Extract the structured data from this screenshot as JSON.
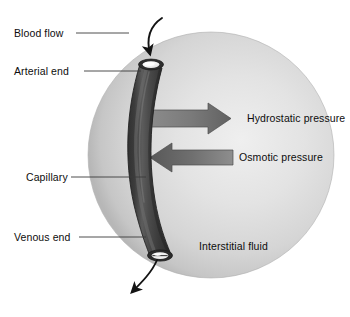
{
  "figure": {
    "background_color": "#ffffff"
  },
  "labels": {
    "blood_flow": "Blood flow",
    "arterial_end": "Arterial end",
    "capillary": "Capillary",
    "venous_end": "Venous end",
    "hydrostatic_pressure": "Hydrostatic pressure",
    "osmotic_pressure": "Osmotic pressure",
    "interstitial_fluid": "Interstitial fluid"
  },
  "colors": {
    "sphere_light": "#e6e6e6",
    "sphere_mid": "#d2d2d2",
    "sphere_edge": "#b9b9b9",
    "capillary_dark": "#3f3f3f",
    "capillary_mid": "#4f4f4f",
    "capillary_highlight": "#6b6b6b",
    "lumen": "#f2f2f2",
    "arrow_light": "#9a9a9a",
    "arrow_dark": "#5a5a5a",
    "flow_arrow": "#1a1a1a",
    "text": "#0d0d0d",
    "leader_line": "#3a3a3a"
  },
  "sphere": {
    "name": "interstitial-fluid-sphere",
    "center_x": 211,
    "center_y": 155,
    "radius": 123
  },
  "capillary": {
    "name": "capillary-tube",
    "orientation": "vertical",
    "curve": "bulges-left",
    "top_x": 151,
    "top_y": 62,
    "bottom_x": 153,
    "bottom_y": 256,
    "width": 28
  },
  "pressure_arrows": [
    {
      "name": "hydrostatic-pressure-arrow",
      "label": "Hydrostatic pressure",
      "direction": "right",
      "meaning": "outward from capillary into interstitial fluid",
      "y": 118
    },
    {
      "name": "osmotic-pressure-arrow",
      "label": "Osmotic pressure",
      "direction": "left",
      "meaning": "inward from interstitial fluid into capillary",
      "y": 157
    }
  ],
  "flow_arrows": [
    {
      "name": "blood-inflow-arrow",
      "direction": "down-into-arterial-end",
      "location": "top"
    },
    {
      "name": "blood-outflow-arrow",
      "direction": "down-out-of-venous-end",
      "location": "bottom"
    }
  ],
  "leader_lines": [
    {
      "name": "leader-blood-flow",
      "x1": 76,
      "x2": 129,
      "y": 33
    },
    {
      "name": "leader-arterial-end",
      "x1": 84,
      "x2": 141,
      "y": 71
    },
    {
      "name": "leader-capillary",
      "x1": 71,
      "x2": 146,
      "y": 177
    },
    {
      "name": "leader-venous-end",
      "x1": 79,
      "x2": 146,
      "y": 237
    }
  ]
}
